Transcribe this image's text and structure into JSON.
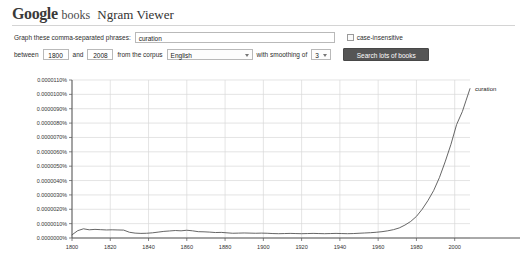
{
  "header": {
    "logo_google": "Google",
    "logo_books": "books",
    "product_name": "Ngram Viewer"
  },
  "form": {
    "phrases_label": "Graph these comma-separated phrases:",
    "phrases_value": "curation",
    "phrases_placeholder": "",
    "case_insensitive_label": "case-insensitive",
    "case_insensitive_checked": false,
    "between_label": "between",
    "start_year": "1800",
    "and_label": "and",
    "end_year": "2008",
    "corpus_label": "from the corpus",
    "corpus_value": "English",
    "smoothing_label": "with smoothing of",
    "smoothing_value": "3",
    "search_button_label": "Search lots of books",
    "dropdown_icon": "chevron-down-icon"
  },
  "chart_data": {
    "type": "line",
    "title": "",
    "xlabel": "",
    "ylabel": "",
    "xlim": [
      1800,
      2008
    ],
    "ylim": [
      0.0,
      1.1e-05
    ],
    "grid": true,
    "legend_position": "right-of-line-end",
    "xticks": [
      1800,
      1820,
      1840,
      1860,
      1880,
      1900,
      1920,
      1940,
      1960,
      1980,
      2000
    ],
    "xtick_labels": [
      "1800",
      "1820",
      "1840",
      "1860",
      "1880",
      "1900",
      "1920",
      "1940",
      "1960",
      "1980",
      "2000"
    ],
    "yticks": [
      0.0,
      1e-06,
      2e-06,
      3e-06,
      4e-06,
      5e-06,
      6e-06,
      7e-06,
      8e-06,
      9e-06,
      1e-05,
      1.1e-05
    ],
    "ytick_labels": [
      "0.0000000%",
      "0.0000010%",
      "0.0000020%",
      "0.0000030%",
      "0.0000040%",
      "0.0000050%",
      "0.0000060%",
      "0.0000070%",
      "0.0000080%",
      "0.0000090%",
      "0.0000100%",
      "0.0000110%"
    ],
    "series": [
      {
        "name": "curation",
        "color": "#555555",
        "x": [
          1800,
          1803,
          1806,
          1809,
          1812,
          1815,
          1818,
          1821,
          1824,
          1827,
          1830,
          1833,
          1836,
          1839,
          1842,
          1845,
          1848,
          1851,
          1854,
          1857,
          1860,
          1863,
          1866,
          1869,
          1872,
          1875,
          1878,
          1881,
          1884,
          1887,
          1890,
          1893,
          1896,
          1899,
          1902,
          1905,
          1908,
          1911,
          1914,
          1917,
          1920,
          1923,
          1926,
          1929,
          1932,
          1935,
          1938,
          1941,
          1944,
          1947,
          1950,
          1953,
          1956,
          1959,
          1962,
          1965,
          1968,
          1971,
          1974,
          1977,
          1980,
          1983,
          1986,
          1989,
          1992,
          1995,
          1998,
          2001,
          2004,
          2006,
          2008
        ],
        "y": [
          2.2e-07,
          5.1e-07,
          6.4e-07,
          5.7e-07,
          6e-07,
          5.8e-07,
          5.6e-07,
          5.7e-07,
          5.6e-07,
          5.5e-07,
          4e-07,
          3.4e-07,
          3.2e-07,
          3.3e-07,
          3.6e-07,
          4.1e-07,
          4.6e-07,
          4.9e-07,
          5.2e-07,
          5e-07,
          5.4e-07,
          5e-07,
          4.4e-07,
          4.3e-07,
          4.1e-07,
          3.8e-07,
          3.9e-07,
          3.6e-07,
          3.3e-07,
          3.4e-07,
          3.5e-07,
          3.4e-07,
          3.3e-07,
          3.4e-07,
          3.3e-07,
          3.1e-07,
          3e-07,
          3.1e-07,
          3.2e-07,
          3.1e-07,
          3e-07,
          3.1e-07,
          3.2e-07,
          3.1e-07,
          3e-07,
          3.1e-07,
          3.2e-07,
          3.1e-07,
          3e-07,
          3.1e-07,
          3.3e-07,
          3.5e-07,
          3.7e-07,
          4e-07,
          4.4e-07,
          5e-07,
          5.8e-07,
          7e-07,
          9e-07,
          1.15e-06,
          1.5e-06,
          2e-06,
          2.6e-06,
          3.3e-06,
          4.2e-06,
          5.3e-06,
          6.5e-06,
          7.9e-06,
          8.8e-06,
          9.6e-06,
          1.04e-05
        ]
      }
    ]
  }
}
